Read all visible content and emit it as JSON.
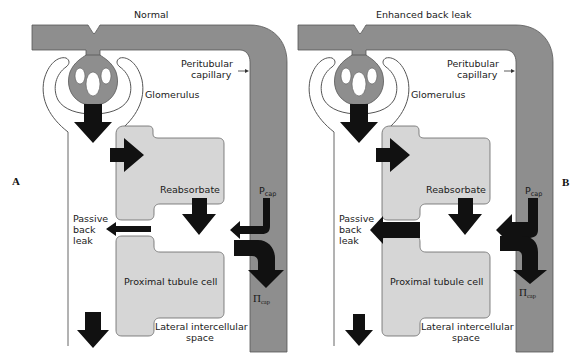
{
  "panels": [
    {
      "id": "A",
      "letter": "A",
      "title": "Normal",
      "labels": {
        "capillary": [
          "Peritubular",
          "capillary"
        ],
        "glomerulus": "Glomerulus",
        "reabsorbate": "Reabsorbate",
        "p_cap_main": "P",
        "p_cap_sub": "cap",
        "pi_cap_main": "Π",
        "pi_cap_sub": "cap",
        "back_leak": [
          "Passive",
          "back",
          "leak"
        ],
        "cell": "Proximal tubule cell",
        "lis": [
          "Lateral intercellular",
          "space"
        ]
      }
    },
    {
      "id": "B",
      "letter": "B",
      "title": "Enhanced back leak",
      "labels": {
        "capillary": [
          "Peritubular",
          "capillary"
        ],
        "glomerulus": "Glomerulus",
        "reabsorbate": "Reabsorbate",
        "p_cap_main": "P",
        "p_cap_sub": "cap",
        "pi_cap_main": "Π",
        "pi_cap_sub": "cap",
        "back_leak": [
          "Passive",
          "back",
          "leak"
        ],
        "cell": "Proximal tubule cell",
        "lis": [
          "Lateral intercellular",
          "space"
        ]
      }
    }
  ],
  "colors": {
    "capillary": "#8e8e8e",
    "cell": "#d6d6d6",
    "arrow": "#111111",
    "outline": "#555555"
  }
}
